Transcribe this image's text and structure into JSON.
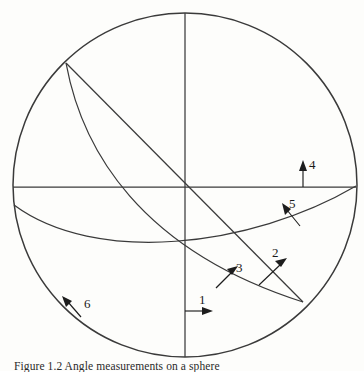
{
  "figure": {
    "kind": "stereographic-projection-diagram",
    "caption": "Figure 1.2 Angle measurements on a sphere",
    "background_color": "#fdfdfb",
    "line_color": "#3a3a3a",
    "label_color": "#1a1a1a",
    "circle": {
      "center_x": 185,
      "center_y": 185,
      "radius": 172
    },
    "labels": [
      {
        "id": "1",
        "text": "1",
        "x": 202,
        "y": 305,
        "arrow_direction": "right"
      },
      {
        "id": "2",
        "text": "2",
        "x": 277,
        "y": 256,
        "arrow_direction": "up-right"
      },
      {
        "id": "3",
        "text": "3",
        "x": 239,
        "y": 269,
        "arrow_direction": "up-right"
      },
      {
        "id": "4",
        "text": "4",
        "x": 312,
        "y": 166,
        "arrow_direction": "up"
      },
      {
        "id": "5",
        "text": "5",
        "x": 292,
        "y": 205,
        "arrow_direction": "up-left"
      },
      {
        "id": "6",
        "text": "6",
        "x": 84,
        "y": 304,
        "arrow_direction": "up-left"
      }
    ]
  }
}
